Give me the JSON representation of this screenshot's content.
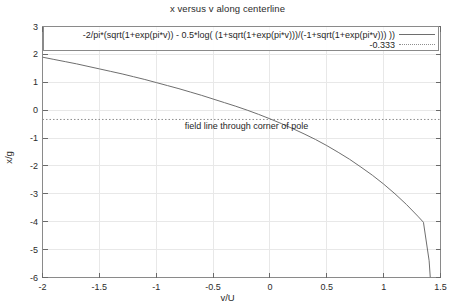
{
  "chart_data": {
    "type": "line",
    "title": "x versus v along centerline",
    "xlabel": "v/U",
    "ylabel": "x/g",
    "xlim": [
      -2,
      1.5
    ],
    "ylim": [
      -6,
      3
    ],
    "grid": true,
    "legend_position": "inside-top",
    "xticks": [
      "-2",
      "-1.5",
      "-1",
      "-0.5",
      "0",
      "0.5",
      "1",
      "1.5"
    ],
    "xtick_values": [
      -2,
      -1.5,
      -1,
      -0.5,
      0,
      0.5,
      1,
      1.5
    ],
    "yticks": [
      "3",
      "2",
      "1",
      "0",
      "-1",
      "-2",
      "-3",
      "-4",
      "-5",
      "-6"
    ],
    "ytick_values": [
      3,
      2,
      1,
      0,
      -1,
      -2,
      -3,
      -4,
      -5,
      -6
    ],
    "annotations": [
      {
        "text": "field line through corner of pole",
        "x": -0.75,
        "y": -0.62
      }
    ],
    "series": [
      {
        "name": "-2/pi*(sqrt(1+exp(pi*v)) - 0.5*log( (1+sqrt(1+exp(pi*v)))/(-1+sqrt(1+exp(pi*v))) ))",
        "style": "solid",
        "color": "#6e6e6e",
        "x": [
          -2,
          -1.9,
          -1.8,
          -1.7,
          -1.6,
          -1.5,
          -1.4,
          -1.3,
          -1.2,
          -1.1,
          -1,
          -0.9,
          -0.8,
          -0.7,
          -0.6,
          -0.5,
          -0.4,
          -0.3,
          -0.2,
          -0.1,
          0,
          0.1,
          0.2,
          0.3,
          0.4,
          0.5,
          0.6,
          0.7,
          0.8,
          0.9,
          1,
          1.1,
          1.2,
          1.3,
          1.35,
          1.4,
          1.41
        ],
        "y": [
          1.9,
          1.82,
          1.74,
          1.66,
          1.57,
          1.48,
          1.39,
          1.3,
          1.2,
          1.1,
          0.99,
          0.88,
          0.77,
          0.65,
          0.53,
          0.4,
          0.27,
          0.14,
          0.0,
          -0.15,
          -0.31,
          -0.48,
          -0.66,
          -0.85,
          -1.05,
          -1.27,
          -1.51,
          -1.76,
          -2.04,
          -2.33,
          -2.65,
          -3.0,
          -3.38,
          -3.8,
          -4.02,
          -5.4,
          -6.0
        ]
      },
      {
        "name": "-0.333",
        "style": "dotted",
        "color": "#8e8e8e",
        "constant_y": -0.333
      }
    ]
  }
}
